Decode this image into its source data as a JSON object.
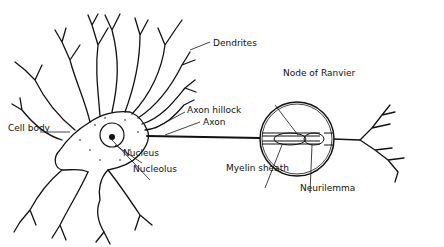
{
  "diagram": {
    "labels": {
      "dendrites": "Dendrites",
      "axon_hillock": "Axon hillock",
      "axon": "Axon",
      "cell_body": "Cell body",
      "nucleus": "Nucleus",
      "nucleolus": "Nucleolus",
      "node_of_ranvier": "Node of Ranvier",
      "myelin_sheath": "Myelin sheath",
      "neurilemma": "Neurilemma"
    },
    "colors": {
      "ink": "#111111",
      "background": "#ffffff"
    }
  }
}
